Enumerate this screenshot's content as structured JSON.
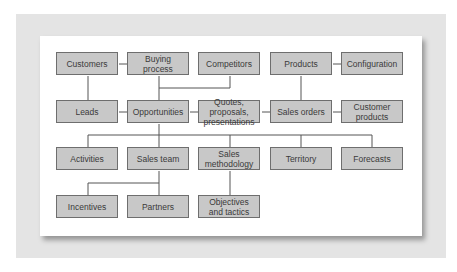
{
  "diagram": {
    "nodes": [
      {
        "id": "customers",
        "label": "Customers"
      },
      {
        "id": "buying-process",
        "label": "Buying\nprocess"
      },
      {
        "id": "competitors",
        "label": "Competitors"
      },
      {
        "id": "products",
        "label": "Products"
      },
      {
        "id": "configuration",
        "label": "Configuration"
      },
      {
        "id": "leads",
        "label": "Leads"
      },
      {
        "id": "opportunities",
        "label": "Opportunities"
      },
      {
        "id": "quotes",
        "label": "Quotes, proposals,\npresentations"
      },
      {
        "id": "sales-orders",
        "label": "Sales orders"
      },
      {
        "id": "customer-products",
        "label": "Customer\nproducts"
      },
      {
        "id": "activities",
        "label": "Activities"
      },
      {
        "id": "sales-team",
        "label": "Sales team"
      },
      {
        "id": "sales-methodology",
        "label": "Sales\nmethodology"
      },
      {
        "id": "territory",
        "label": "Territory"
      },
      {
        "id": "forecasts",
        "label": "Forecasts"
      },
      {
        "id": "incentives",
        "label": "Incentives"
      },
      {
        "id": "partners",
        "label": "Partners"
      },
      {
        "id": "objectives",
        "label": "Objectives\nand tactics"
      }
    ],
    "edges": [
      [
        "customers",
        "buying-process"
      ],
      [
        "customers",
        "leads"
      ],
      [
        "products",
        "configuration"
      ],
      [
        "products",
        "sales-orders"
      ],
      [
        "leads",
        "opportunities"
      ],
      [
        "buying-process",
        "opportunities"
      ],
      [
        "competitors",
        "opportunities"
      ],
      [
        "opportunities",
        "quotes"
      ],
      [
        "quotes",
        "sales-orders"
      ],
      [
        "sales-orders",
        "customer-products"
      ],
      [
        "opportunities",
        "activities"
      ],
      [
        "opportunities",
        "sales-team"
      ],
      [
        "opportunities",
        "sales-methodology"
      ],
      [
        "opportunities",
        "territory"
      ],
      [
        "opportunities",
        "forecasts"
      ],
      [
        "sales-team",
        "incentives"
      ],
      [
        "sales-team",
        "partners"
      ],
      [
        "sales-methodology",
        "objectives"
      ]
    ]
  }
}
